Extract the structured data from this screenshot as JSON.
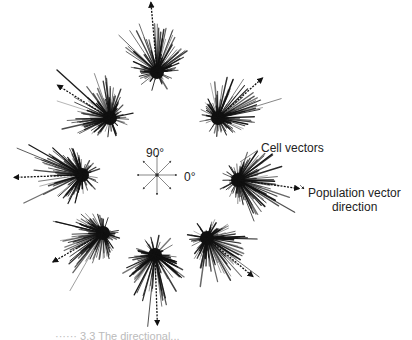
{
  "figure": {
    "compass": {
      "label_90": "90°",
      "label_0": "0°",
      "center": [
        157,
        175
      ],
      "directions_deg": [
        0,
        45,
        90,
        135,
        180,
        225,
        270,
        315
      ]
    },
    "annotations": {
      "cell_vectors": "Cell vectors",
      "population_line1": "Population vector",
      "population_line2": "direction"
    },
    "caption_partial": "······ 3.3  The directional...",
    "colors": {
      "ink": "#111111",
      "background": "#ffffff"
    },
    "clusters": [
      {
        "name": "dir-90",
        "cx": 157,
        "cy": 72,
        "pop_angle": 95,
        "pop_len": 70
      },
      {
        "name": "dir-45",
        "cx": 218,
        "cy": 118,
        "pop_angle": 42,
        "pop_len": 60
      },
      {
        "name": "dir-0",
        "cx": 238,
        "cy": 180,
        "pop_angle": -8,
        "pop_len": 62
      },
      {
        "name": "dir-315",
        "cx": 207,
        "cy": 238,
        "pop_angle": -40,
        "pop_len": 60
      },
      {
        "name": "dir-270",
        "cx": 155,
        "cy": 255,
        "pop_angle": -88,
        "pop_len": 70
      },
      {
        "name": "dir-225",
        "cx": 103,
        "cy": 233,
        "pop_angle": 210,
        "pop_len": 58
      },
      {
        "name": "dir-180",
        "cx": 82,
        "cy": 175,
        "pop_angle": 182,
        "pop_len": 68
      },
      {
        "name": "dir-135",
        "cx": 110,
        "cy": 118,
        "pop_angle": 148,
        "pop_len": 62
      }
    ]
  }
}
